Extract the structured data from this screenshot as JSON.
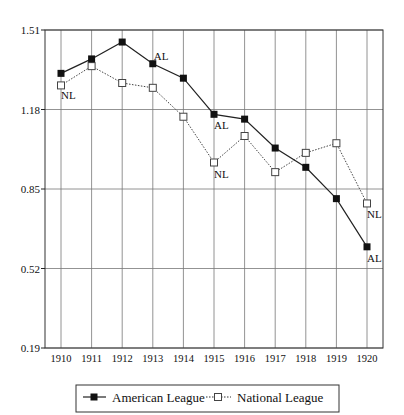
{
  "chart_data": {
    "type": "line",
    "title": "",
    "xlabel": "",
    "ylabel": "",
    "x": [
      "1910",
      "1911",
      "1912",
      "1913",
      "1914",
      "1915",
      "1916",
      "1917",
      "1918",
      "1919",
      "1920"
    ],
    "y_ticks": [
      "1.51",
      "1.18",
      "0.85",
      "0.52",
      "0.19"
    ],
    "ylim": [
      0.19,
      1.51
    ],
    "grid": true,
    "legend_position": "bottom",
    "series": [
      {
        "name": "American League",
        "marker": "filled-square",
        "line": "solid",
        "values": [
          1.33,
          1.39,
          1.46,
          1.37,
          1.31,
          1.16,
          1.14,
          1.02,
          0.94,
          0.81,
          0.61
        ]
      },
      {
        "name": "National League",
        "marker": "open-square",
        "line": "dotted",
        "values": [
          1.28,
          1.36,
          1.29,
          1.27,
          1.15,
          0.96,
          1.07,
          0.92,
          1.0,
          1.04,
          0.79
        ]
      }
    ],
    "annotations": [
      {
        "text": "NL",
        "x": "1910",
        "series": "National League"
      },
      {
        "text": "AL",
        "x": "1913",
        "series": "American League"
      },
      {
        "text": "AL",
        "x": "1915",
        "series": "American League"
      },
      {
        "text": "NL",
        "x": "1915",
        "series": "National League"
      },
      {
        "text": "NL",
        "x": "1920",
        "series": "National League"
      },
      {
        "text": "AL",
        "x": "1920",
        "series": "American League"
      }
    ]
  },
  "legend": {
    "items": [
      {
        "label": "American League"
      },
      {
        "label": "National League"
      }
    ]
  }
}
